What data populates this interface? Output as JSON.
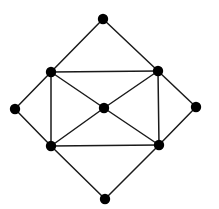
{
  "graph": {
    "node_radius": 5.2,
    "node_color": "#000000",
    "edge_color": "#1a1a1a",
    "nodes": [
      {
        "id": "top",
        "x": 103,
        "y": 19
      },
      {
        "id": "upper-left",
        "x": 51,
        "y": 72
      },
      {
        "id": "upper-right",
        "x": 158,
        "y": 71
      },
      {
        "id": "left",
        "x": 15,
        "y": 109
      },
      {
        "id": "center",
        "x": 104,
        "y": 108
      },
      {
        "id": "right",
        "x": 196,
        "y": 107
      },
      {
        "id": "lower-left",
        "x": 51,
        "y": 146
      },
      {
        "id": "lower-right",
        "x": 159,
        "y": 145
      },
      {
        "id": "bottom",
        "x": 105,
        "y": 199
      }
    ],
    "edges": [
      [
        "top",
        "upper-left"
      ],
      [
        "top",
        "upper-right"
      ],
      [
        "upper-left",
        "upper-right"
      ],
      [
        "upper-left",
        "left"
      ],
      [
        "upper-left",
        "lower-left"
      ],
      [
        "upper-left",
        "center"
      ],
      [
        "upper-right",
        "right"
      ],
      [
        "upper-right",
        "lower-right"
      ],
      [
        "upper-right",
        "center"
      ],
      [
        "left",
        "lower-left"
      ],
      [
        "right",
        "lower-right"
      ],
      [
        "lower-left",
        "lower-right"
      ],
      [
        "lower-left",
        "center"
      ],
      [
        "lower-right",
        "center"
      ],
      [
        "lower-left",
        "bottom"
      ],
      [
        "lower-right",
        "bottom"
      ]
    ]
  }
}
